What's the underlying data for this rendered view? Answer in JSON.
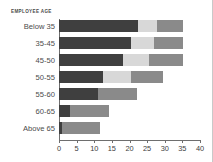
{
  "chart": {
    "title": "EMPLOYEE AGE"
  },
  "chart_data": {
    "type": "bar",
    "orientation": "horizontal",
    "stacked": true,
    "title": "EMPLOYEE AGE",
    "xlabel": "",
    "ylabel": "",
    "xlim": [
      0,
      40
    ],
    "ylim": null,
    "grid": false,
    "legend": "none",
    "xticks": [
      0,
      5,
      10,
      15,
      20,
      25,
      30,
      35,
      40
    ],
    "categories": [
      "Below 35",
      "35-45",
      "45-50",
      "50-55",
      "55-60",
      "60-65",
      "Above 65"
    ],
    "series": [
      {
        "name": "segment-1",
        "color": "#3f3f3f",
        "values": [
          22.4,
          20.4,
          18.2,
          12.5,
          11.0,
          3.2,
          0.9
        ]
      },
      {
        "name": "segment-2",
        "color": "#d8d8d8",
        "values": [
          5.4,
          6.5,
          7.3,
          7.9,
          0,
          0,
          0
        ]
      },
      {
        "name": "segment-3",
        "color": "#8a8a8a",
        "values": [
          7.3,
          8.2,
          9.6,
          9.1,
          11.1,
          11.0,
          10.7
        ]
      }
    ],
    "totals": [
      35.1,
      35.1,
      35.1,
      29.5,
      22.1,
      14.2,
      11.6
    ]
  },
  "colors": {
    "segment_dark": "#3f3f3f",
    "segment_light": "#d8d8d8",
    "segment_medium": "#8a8a8a",
    "axis": "#6e6e6e",
    "text": "#4b4b4b",
    "background": "#ffffff"
  }
}
